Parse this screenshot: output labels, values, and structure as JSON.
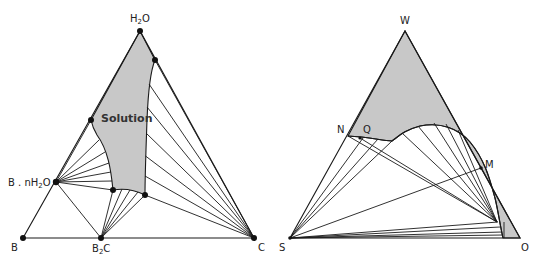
{
  "figure": {
    "colors": {
      "line": "#1a1a1a",
      "shaded_region": "#c8c8c8",
      "background": "#ffffff",
      "points": "#111111"
    }
  },
  "left_diagram": {
    "vertices": {
      "top": {
        "label": "H",
        "sub": "2",
        "tail": "O",
        "full": "H2O"
      },
      "bottom_left": {
        "label": "B"
      },
      "bottom_right": {
        "label": "C"
      }
    },
    "points": {
      "hydrate": {
        "label": "B . nH",
        "sub": "2",
        "tail": "O",
        "full": "B.nH2O"
      },
      "compound": {
        "label": "B",
        "sub": "2",
        "tail": "C",
        "full": "B2C"
      }
    },
    "region_label": "Solution"
  },
  "right_diagram": {
    "vertices": {
      "top": {
        "label": "W"
      },
      "bottom_left": {
        "label": "S"
      },
      "bottom_right": {
        "label": "O"
      }
    },
    "points": {
      "n": {
        "label": "N"
      },
      "q": {
        "label": "Q"
      },
      "m": {
        "label": "M"
      }
    }
  }
}
